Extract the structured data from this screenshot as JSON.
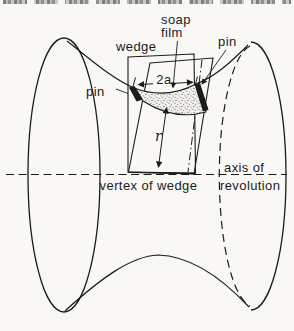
{
  "figure": {
    "type": "physics-diagram",
    "ink_color": "#1c1c1c",
    "paper_color": "#f9f8f5",
    "film_dot_color": "#5a5a5a",
    "labels": {
      "wedge": "wedge",
      "soap_film_line1": "soap",
      "soap_film_line2": "film",
      "pin_top_right": "pin",
      "pin_left": "pin",
      "chord_width": "2a",
      "radius": "r",
      "vertex_of_wedge": "vertex of wedge",
      "axis_line1": "axis of",
      "axis_line2": "revolution"
    }
  }
}
